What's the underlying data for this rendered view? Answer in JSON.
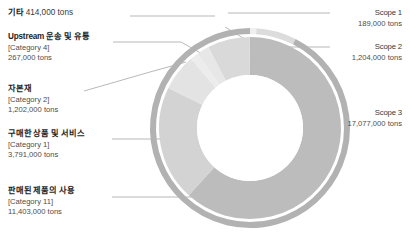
{
  "chart_data": {
    "type": "pie",
    "title": "",
    "subtitle": "",
    "xlabel": "",
    "ylabel": "",
    "legend_position": "callout-labels",
    "grid": false,
    "unit": "tons",
    "rings": [
      {
        "name": "outer-scope-ring",
        "labels": [
          "Scope 1",
          "Scope 2",
          "Scope 3"
        ],
        "values": [
          189000,
          1204000,
          17077000
        ]
      },
      {
        "name": "inner-category-ring",
        "labels": [
          "기타",
          "Upstream 운송 및 유통",
          "자본재",
          "구매한 상품 및 서비스",
          "판매된 제품의 사용"
        ],
        "values": [
          414000,
          267000,
          1202000,
          3791000,
          11403000
        ]
      }
    ],
    "total": 18470000
  },
  "colors": {
    "ring_outer": "#b2b2b2",
    "ring_inner_dark": "#b7b7b7",
    "ring_inner_mid": "#c9c9c9",
    "ring_inner_light": "#dcdcdc",
    "ring_inner_lighter": "#e6e6e6",
    "ring_inner_lightest": "#efefef",
    "leader_line": "#9a9a9a",
    "text": "#2b2b2b"
  },
  "left_labels": [
    {
      "id": "etc",
      "title": "기타",
      "title_suffix": "414,000 tons",
      "category": "",
      "value": ""
    },
    {
      "id": "upstream-transport",
      "title": "Upstream 운송 및 유통",
      "title_suffix": "",
      "category": "[Category 4]",
      "value": "267,000 tons"
    },
    {
      "id": "capital-goods",
      "title": "자본재",
      "title_suffix": "",
      "category": "[Category 2]",
      "value": "1,202,000 tons"
    },
    {
      "id": "purchased-goods-services",
      "title": "구매한 상품 및 서비스",
      "title_suffix": "",
      "category": "[Category 1]",
      "value": "3,791,000 tons"
    },
    {
      "id": "use-of-sold-products",
      "title": "판매된 제품의 사용",
      "title_suffix": "",
      "category": "[Category 11]",
      "value": "11,403,000 tons"
    }
  ],
  "right_labels": [
    {
      "id": "scope-1",
      "title": "Scope 1",
      "value": "189,000 tons"
    },
    {
      "id": "scope-2",
      "title": "Scope 2",
      "value": "1,204,000 tons"
    },
    {
      "id": "scope-3",
      "title": "Scope 3",
      "value": "17,077,000 tons"
    }
  ]
}
